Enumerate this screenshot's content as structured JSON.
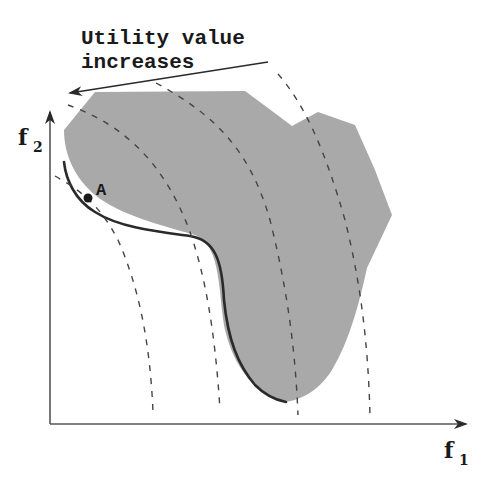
{
  "diagram": {
    "annotation": {
      "line1": "Utility value",
      "line2": "increases"
    },
    "axes": {
      "x_label": "f",
      "x_subscript": "1",
      "y_label": "f",
      "y_subscript": "2"
    },
    "point": {
      "label": "A"
    },
    "colors": {
      "region_fill": "#a9a9a9",
      "pareto_front": "#2a2a2a",
      "dashed_curves": "#444444",
      "axes": "#555555"
    },
    "elements": [
      "feasible objective region (shaded)",
      "Pareto front (bold boundary on lower-left)",
      "4 dashed utility indifference curves",
      "arrow showing direction of increasing utility",
      "point A: tangency of utility curve with Pareto front"
    ]
  }
}
